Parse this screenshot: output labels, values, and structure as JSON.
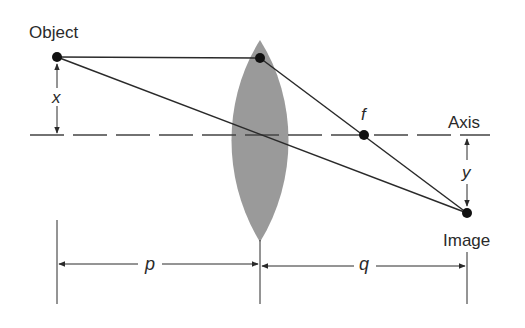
{
  "diagram": {
    "labels": {
      "object": "Object",
      "image": "Image",
      "axis": "Axis",
      "focal": "f",
      "object_height": "x",
      "image_height": "y",
      "object_distance": "p",
      "image_distance": "q"
    },
    "colors": {
      "lens_fill": "#9a9a9a",
      "line": "#2a2a2a",
      "background": "#ffffff"
    },
    "points": {
      "object": [
        57,
        57
      ],
      "lens_top_ray": [
        260,
        58
      ],
      "lens_center": [
        260,
        135
      ],
      "focal_point": [
        364,
        135
      ],
      "image": [
        467,
        213
      ]
    },
    "axis_y": 135,
    "dimension_line_y": 264
  }
}
